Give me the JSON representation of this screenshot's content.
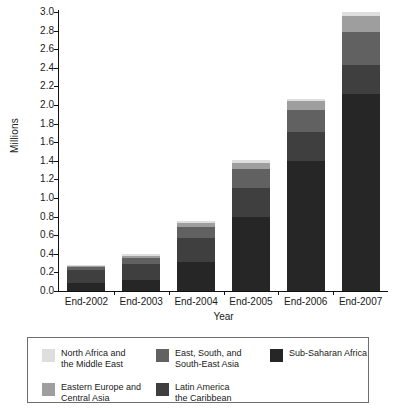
{
  "chart_data": {
    "type": "bar",
    "stacked": true,
    "title": "",
    "xlabel": "Year",
    "ylabel": "Millions",
    "categories": [
      "End-2002",
      "End-2003",
      "End-2004",
      "End-2005",
      "End-2006",
      "End-2007"
    ],
    "ylim": [
      0.0,
      3.0
    ],
    "ytick_step": 0.2,
    "ytick_labels": [
      "3.0",
      "2.8",
      "2.6",
      "2.4",
      "2.2",
      "2.0",
      "1.8",
      "1.6",
      "1.4",
      "1.2",
      "1.0",
      "0.8",
      "0.6",
      "0.4",
      "0.2",
      "0.0"
    ],
    "grid": false,
    "legend_position": "bottom",
    "series": [
      {
        "name": "Sub-Saharan Africa",
        "color": "#262626",
        "values": [
          0.09,
          0.12,
          0.31,
          0.8,
          1.4,
          2.12
        ]
      },
      {
        "name": "Latin America\nthe Caribbean",
        "color": "#3f3f3f",
        "values": [
          0.14,
          0.17,
          0.26,
          0.31,
          0.31,
          0.31
        ]
      },
      {
        "name": "East, South, and\nSouth-East Asia",
        "color": "#616161",
        "values": [
          0.03,
          0.06,
          0.12,
          0.2,
          0.24,
          0.36
        ]
      },
      {
        "name": "Eastern Europe and\nCentral Asia",
        "color": "#9e9e9e",
        "values": [
          0.01,
          0.03,
          0.04,
          0.07,
          0.09,
          0.17
        ]
      },
      {
        "name": "North Africa and\nthe Middle East",
        "color": "#dedede",
        "values": [
          0.01,
          0.02,
          0.02,
          0.03,
          0.03,
          0.04
        ]
      }
    ],
    "totals": [
      0.28,
      0.4,
      0.75,
      1.41,
      2.07,
      3.0
    ]
  },
  "axes": {
    "y_title": "Millions",
    "x_title": "Year"
  },
  "legend": {
    "items": [
      {
        "label": "North Africa and\nthe Middle East",
        "color": "#dedede"
      },
      {
        "label": "East, South, and\nSouth-East Asia",
        "color": "#616161"
      },
      {
        "label": "Sub-Saharan Africa",
        "color": "#262626"
      },
      {
        "label": "Eastern Europe and\nCentral Asia",
        "color": "#9e9e9e"
      },
      {
        "label": "Latin America\nthe Caribbean",
        "color": "#3f3f3f"
      }
    ]
  }
}
